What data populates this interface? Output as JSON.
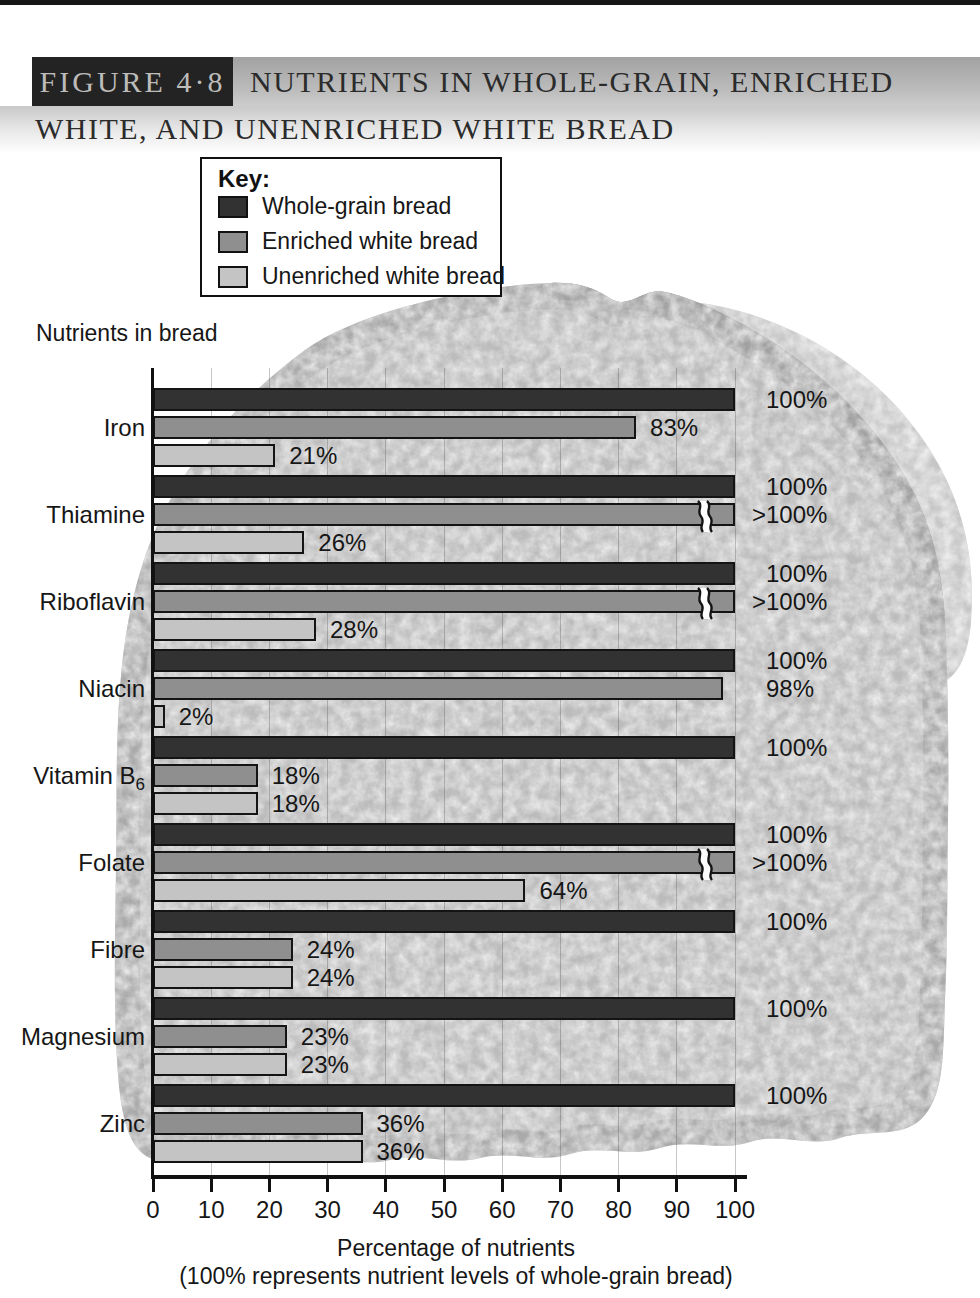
{
  "header": {
    "figure_label": "FIGURE 4·8",
    "title_line1": "NUTRIENTS IN WHOLE-GRAIN, ENRICHED",
    "title_line2": "WHITE, AND UNENRICHED WHITE BREAD"
  },
  "legend": {
    "title": "Key:"
  },
  "chart_data": {
    "type": "bar",
    "orientation": "horizontal",
    "figure": "FIGURE 4·8",
    "ylabel": "Nutrients in bread",
    "xlabel": "Percentage of nutrients",
    "xlabel_note": "(100% represents nutrient levels of whole-grain bread)",
    "xlim": [
      0,
      100
    ],
    "xticks": [
      0,
      10,
      20,
      30,
      40,
      50,
      60,
      70,
      80,
      90,
      100
    ],
    "grid": true,
    "legend_position": "top-left",
    "categories": [
      "Iron",
      "Thiamine",
      "Riboflavin",
      "Niacin",
      "Vitamin B6",
      "Folate",
      "Fibre",
      "Magnesium",
      "Zinc"
    ],
    "subscript_categories": [
      "Vitamin B6"
    ],
    "series": [
      {
        "name": "Whole-grain bread",
        "color": "#323232",
        "values": [
          100,
          100,
          100,
          100,
          100,
          100,
          100,
          100,
          100
        ],
        "labels": [
          "100%",
          "100%",
          "100%",
          "100%",
          "100%",
          "100%",
          "100%",
          "100%",
          "100%"
        ]
      },
      {
        "name": "Enriched white bread",
        "color": "#8f8f8f",
        "values": [
          83,
          100,
          100,
          98,
          18,
          100,
          24,
          23,
          36
        ],
        "labels": [
          "83%",
          ">100%",
          ">100%",
          "98%",
          "18%",
          ">100%",
          "24%",
          "23%",
          "36%"
        ]
      },
      {
        "name": "Unenriched white bread",
        "color": "#c4c4c4",
        "values": [
          21,
          26,
          28,
          2,
          18,
          64,
          24,
          23,
          36
        ],
        "labels": [
          "21%",
          "26%",
          "28%",
          "2%",
          "18%",
          "64%",
          "24%",
          "23%",
          "36%"
        ]
      }
    ]
  }
}
